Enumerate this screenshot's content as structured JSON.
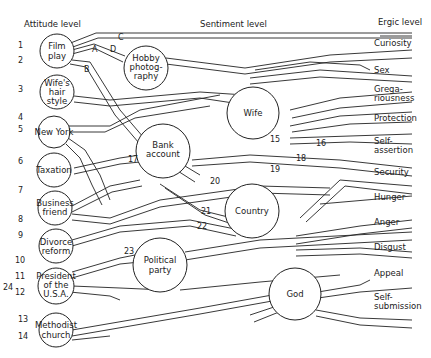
{
  "headers": {
    "attitude": "Attitude level",
    "sentiment": "Sentiment level",
    "ergic": "Ergic level"
  },
  "attitudes": [
    {
      "id": "film",
      "lines": [
        "Film",
        "play"
      ],
      "nums": [
        "1",
        "2"
      ]
    },
    {
      "id": "hair",
      "lines": [
        "Wife's",
        "hair",
        "style"
      ],
      "nums": [
        "3"
      ]
    },
    {
      "id": "ny",
      "lines": [
        "New York"
      ],
      "nums": [
        "4",
        "5"
      ]
    },
    {
      "id": "tax",
      "lines": [
        "Taxation"
      ],
      "nums": [
        "6"
      ]
    },
    {
      "id": "friend",
      "lines": [
        "Business",
        "friend"
      ],
      "nums": [
        "7"
      ]
    },
    {
      "id": "divorce",
      "lines": [
        "Divorce",
        "reform"
      ],
      "nums": [
        "8",
        "9"
      ]
    },
    {
      "id": "president",
      "lines": [
        "President",
        "of the",
        "U.S.A."
      ],
      "nums": [
        "10",
        "11",
        "12",
        "24"
      ]
    },
    {
      "id": "methodist",
      "lines": [
        "Methodist",
        "church"
      ],
      "nums": [
        "13",
        "14"
      ]
    }
  ],
  "sentiments": [
    {
      "id": "hobby",
      "lines": [
        "Hobby",
        "photog-",
        "raphy"
      ]
    },
    {
      "id": "bank",
      "lines": [
        "Bank",
        "account"
      ]
    },
    {
      "id": "wife",
      "lines": [
        "Wife"
      ]
    },
    {
      "id": "country",
      "lines": [
        "Country"
      ]
    },
    {
      "id": "party",
      "lines": [
        "Political",
        "party"
      ]
    },
    {
      "id": "god",
      "lines": [
        "God"
      ]
    }
  ],
  "ergs": [
    {
      "lines": [
        "Curiosity"
      ]
    },
    {
      "lines": [
        "Sex"
      ]
    },
    {
      "lines": [
        "Grega-",
        "riousness"
      ]
    },
    {
      "lines": [
        "Protection"
      ]
    },
    {
      "lines": [
        "Self-",
        "assertion"
      ]
    },
    {
      "lines": [
        "Security"
      ]
    },
    {
      "lines": [
        "Hunger"
      ]
    },
    {
      "lines": [
        "Anger"
      ]
    },
    {
      "lines": [
        "Disgust"
      ]
    },
    {
      "lines": [
        "Appeal"
      ]
    },
    {
      "lines": [
        "Self-",
        "submission"
      ]
    }
  ],
  "path_labels": {
    "A": "A",
    "B": "B",
    "C": "C",
    "D": "D",
    "n15": "15",
    "n16": "16",
    "n17": "17",
    "n18": "18",
    "n19": "19",
    "n20": "20",
    "n21": "21",
    "n22": "22",
    "n23": "23"
  }
}
